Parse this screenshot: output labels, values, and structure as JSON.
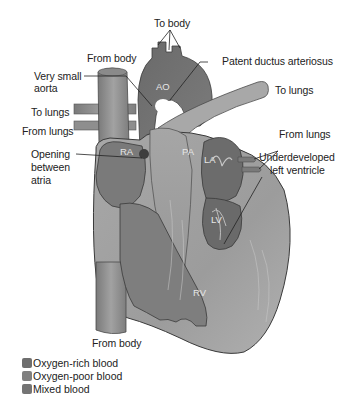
{
  "diagram": {
    "labels": {
      "to_body": "To body",
      "from_body_top": "From body",
      "very_small_aorta_1": "Very small",
      "very_small_aorta_2": "aorta",
      "patent_ductus": "Patent ductus arteriosus",
      "to_lungs_right": "To lungs",
      "to_lungs_left": "To lungs",
      "from_lungs_left": "From lungs",
      "from_lungs_right": "From lungs",
      "opening_1": "Opening",
      "opening_2": "between",
      "opening_3": "atria",
      "underdeveloped_1": "Underdeveloped",
      "underdeveloped_2": "left ventricle",
      "from_body_bottom": "From body"
    },
    "chambers": {
      "ao": "AO",
      "ra": "RA",
      "pa": "PA",
      "la": "LA",
      "lv": "LV",
      "rv": "RV"
    }
  },
  "legend": {
    "items": [
      {
        "label": "Oxygen-rich blood",
        "color": "#6e6e6e"
      },
      {
        "label": "Oxygen-poor blood",
        "color": "#808080"
      },
      {
        "label": "Mixed blood",
        "color": "#747474"
      }
    ]
  },
  "colors": {
    "muscle_light": "#b4b4b4",
    "muscle_mid": "#9a9a9a",
    "chamber_dark": "#6f6f6f",
    "vessel": "#8a8a8a",
    "outline": "#3a3a3a",
    "leader": "#222222"
  }
}
